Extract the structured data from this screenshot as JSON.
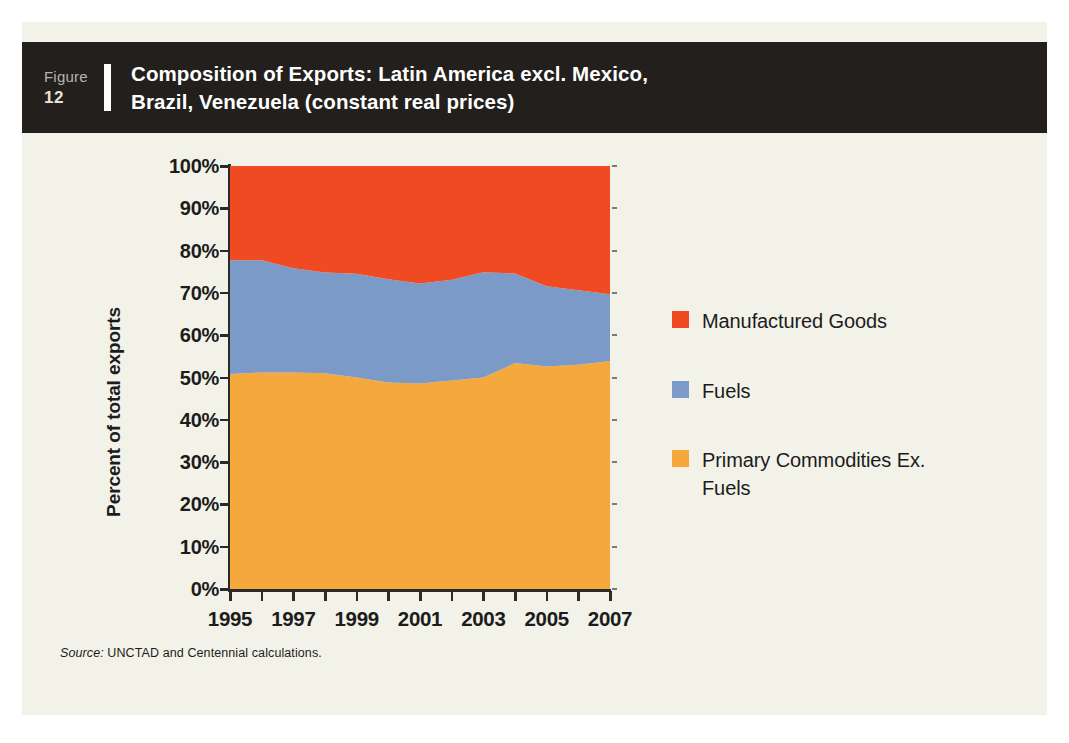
{
  "figure": {
    "label_word": "Figure",
    "number": "12",
    "title": "Composition of Exports: Latin America excl. Mexico, Brazil, Venezuela (constant real prices)",
    "title_line_1": "Composition of Exports: Latin America excl. Mexico,",
    "title_line_2": "Brazil, Venezuela (constant real prices)",
    "header_bg": "#231f1c",
    "panel_bg": "#f2f2e8"
  },
  "source": {
    "prefix": "Source:",
    "text": "UNCTAD and Centennial calculations."
  },
  "legend": {
    "items": [
      {
        "label": "Manufactured Goods",
        "color": "#f04a23"
      },
      {
        "label": "Fuels",
        "color": "#7c9ac8"
      },
      {
        "label": "Primary Commodities Ex. Fuels",
        "color": "#f5a83c"
      }
    ]
  },
  "chart_data": {
    "type": "area",
    "stacked": true,
    "title": "Composition of Exports: Latin America excl. Mexico, Brazil, Venezuela (constant real prices)",
    "xlabel": "",
    "ylabel": "Percent of total exports",
    "ylim": [
      0,
      100
    ],
    "xlim": [
      1995,
      2007
    ],
    "grid": false,
    "legend_position": "right",
    "y_tick_labels": [
      "100%",
      "90%",
      "80%",
      "70%",
      "60%",
      "50%",
      "40%",
      "30%",
      "20%",
      "10%",
      "0%"
    ],
    "y_ticks": [
      100,
      90,
      80,
      70,
      60,
      50,
      40,
      30,
      20,
      10,
      0
    ],
    "x_tick_labels": [
      "1995",
      "1997",
      "1999",
      "2001",
      "2003",
      "2005",
      "2007"
    ],
    "x_ticks_major": [
      1995,
      1997,
      1999,
      2001,
      2003,
      2005,
      2007
    ],
    "x_ticks_all": [
      1995,
      1996,
      1997,
      1998,
      1999,
      2000,
      2001,
      2002,
      2003,
      2004,
      2005,
      2006,
      2007
    ],
    "categories": [
      1995,
      1996,
      1997,
      1998,
      1999,
      2000,
      2001,
      2002,
      2003,
      2004,
      2005,
      2006,
      2007
    ],
    "series": [
      {
        "name": "Primary Commodities Ex. Fuels",
        "color": "#f5a83c",
        "stack_order": 1,
        "values": [
          50.8,
          51.2,
          51.2,
          51.0,
          50.0,
          48.8,
          48.6,
          49.3,
          50.0,
          53.4,
          52.6,
          53.0,
          53.9
        ]
      },
      {
        "name": "Fuels",
        "color": "#7c9ac8",
        "stack_order": 2,
        "values": [
          26.9,
          26.5,
          24.6,
          23.8,
          24.5,
          24.4,
          23.6,
          23.8,
          24.9,
          21.2,
          19.0,
          17.6,
          15.8
        ]
      },
      {
        "name": "Manufactured Goods",
        "color": "#f04a23",
        "stack_order": 3,
        "values": [
          22.3,
          22.3,
          24.2,
          25.2,
          25.5,
          26.8,
          27.8,
          26.9,
          25.1,
          25.4,
          28.4,
          29.4,
          30.3
        ]
      }
    ],
    "cumulative_boundaries": {
      "primary_top": [
        50.8,
        51.2,
        51.2,
        51.0,
        50.0,
        48.8,
        48.6,
        49.3,
        50.0,
        53.4,
        52.6,
        53.0,
        53.9
      ],
      "fuels_top": [
        77.7,
        77.7,
        75.8,
        74.8,
        74.5,
        73.2,
        72.2,
        73.1,
        74.9,
        74.6,
        71.6,
        70.6,
        69.7
      ]
    }
  }
}
